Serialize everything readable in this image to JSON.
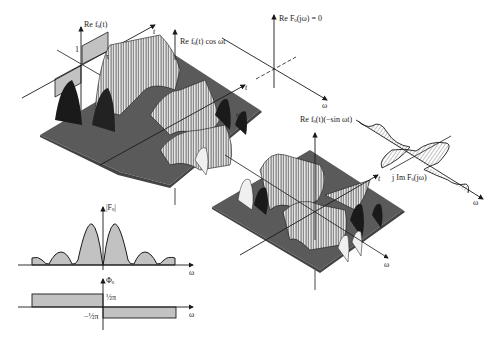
{
  "figure": {
    "panels": {
      "time_signal": {
        "ylabel": "Re fₒ(t)",
        "xlabel": "t",
        "amplitude_label": "1",
        "tau_label": "τ"
      },
      "cos_surface": {
        "ylabel": "Re fₒ(t) cos ωt",
        "t_label": "t",
        "omega_label": "ω"
      },
      "re_spectrum": {
        "ylabel": "Re Fₒ(jω) = 0",
        "omega_label": "ω"
      },
      "sin_surface": {
        "ylabel": "Re fₒ(t)(−sin ωt)",
        "t_label": "t",
        "omega_label": "ω"
      },
      "im_spectrum": {
        "ylabel": "j Im Fₒ(jω)",
        "omega_label": "ω"
      },
      "magnitude": {
        "ylabel": "|Fₒ|",
        "xlabel": "ω"
      },
      "phase": {
        "ylabel": "Φₒ",
        "xlabel": "ω",
        "upper_label": "½π",
        "lower_label": "−½π"
      }
    },
    "colors": {
      "plane": "#5a5a5a",
      "ink": "#1a1a1a",
      "hatch": "#333333",
      "background": "#ffffff"
    }
  }
}
